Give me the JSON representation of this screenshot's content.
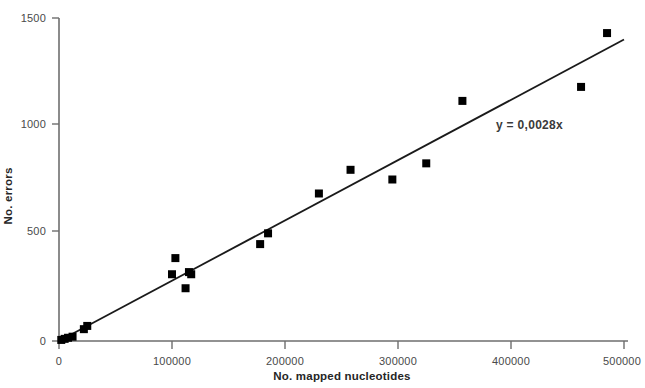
{
  "chart_data": {
    "type": "scatter",
    "title": "",
    "xlabel": "No. mapped nucleotides",
    "ylabel": "No. errors",
    "xlim": [
      0,
      500000
    ],
    "ylim": [
      0,
      1500
    ],
    "xticks": [
      0,
      100000,
      200000,
      300000,
      400000,
      500000
    ],
    "yticks": [
      0,
      500,
      1000,
      1500
    ],
    "xtick_labels": [
      "0",
      "100000",
      "200000",
      "300000",
      "400000",
      "500000"
    ],
    "ytick_labels": [
      "0",
      "500",
      "1000",
      "1500"
    ],
    "grid": false,
    "legend": null,
    "marker": "square",
    "marker_color": "#000000",
    "series": [
      {
        "name": "observed",
        "x": [
          2000,
          5000,
          8000,
          12000,
          22000,
          25000,
          100000,
          103000,
          112000,
          115000,
          117000,
          178000,
          185000,
          230000,
          258000,
          295000,
          325000,
          357000,
          462000,
          485000
        ],
        "y": [
          5,
          10,
          15,
          20,
          55,
          70,
          310,
          385,
          245,
          320,
          310,
          450,
          500,
          685,
          795,
          750,
          825,
          1115,
          1180,
          1430
        ]
      }
    ],
    "trendline": {
      "equation": "y = 0,0028x",
      "slope": 0.0028,
      "intercept": 0,
      "color": "#1a1a1a",
      "x_start": 0,
      "x_end": 500000
    }
  }
}
